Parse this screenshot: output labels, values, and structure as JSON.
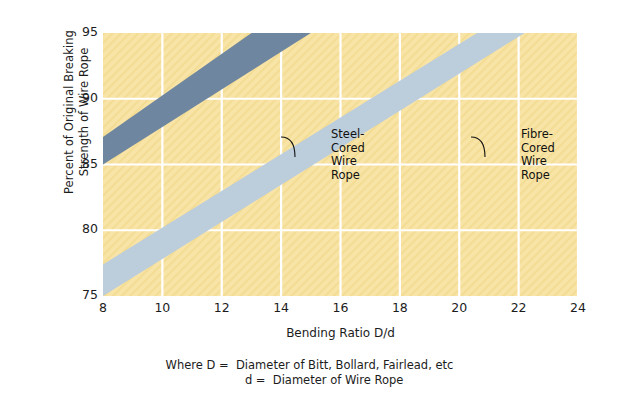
{
  "chart_data": {
    "type": "area",
    "title": "",
    "xlabel": "Bending Ratio D/d",
    "ylabel_line1": "Percent of Original Breaking",
    "ylabel_line2": "Strength of Wire Rope",
    "xlim": [
      8,
      24
    ],
    "ylim": [
      75,
      95
    ],
    "xticks": [
      8,
      10,
      12,
      14,
      16,
      18,
      20,
      22,
      24
    ],
    "yticks": [
      75,
      80,
      85,
      90,
      95
    ],
    "grid": true,
    "legend_position": "inline-annotations",
    "plot_background": "#f8e4a6",
    "grid_color": "#ffffff",
    "series": [
      {
        "name": "Steel-Cored Wire Rope",
        "label": "Steel-\nCored\nWire\nRope",
        "color": "#6e86a0",
        "upper": [
          {
            "x": 8,
            "y": 87.1
          },
          {
            "x": 13.0,
            "y": 95.0
          }
        ],
        "lower": [
          {
            "x": 8,
            "y": 85.0
          },
          {
            "x": 15.0,
            "y": 95.0
          }
        ]
      },
      {
        "name": "Fibre-Cored Wire Rope",
        "label": "Fibre-\nCored\nWire\nRope",
        "color": "#bccddc",
        "upper": [
          {
            "x": 8,
            "y": 77.4
          },
          {
            "x": 20.6,
            "y": 95.0
          }
        ],
        "lower": [
          {
            "x": 8,
            "y": 75.0
          },
          {
            "x": 22.2,
            "y": 95.0
          }
        ]
      }
    ],
    "footnote": [
      "Where D =  Diameter of Bitt, Bollard, Fairlead, etc",
      "        d =  Diameter of Wire Rope"
    ]
  }
}
